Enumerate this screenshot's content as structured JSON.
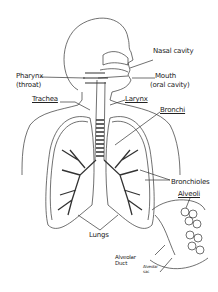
{
  "diagram": {
    "labels": {
      "nasal_cavity": "Nasal cavity",
      "pharynx": "Pharynx",
      "throat": "(throat)",
      "mouth": "Mouth",
      "oral_cavity": "(oral cavity)",
      "trachea": "Trachea",
      "larynx": "Larynx",
      "bronchi": "Bronchi",
      "bronchioles": "Bronchioles",
      "alveoli": "Alveoli",
      "lungs": "Lungs",
      "alveolar_duct_1": "Alveolar",
      "alveolar_duct_2": "Duct",
      "alveolar_sac_1": "Alveolar",
      "alveolar_sac_2": "sac"
    },
    "colors": {
      "line": "#333333",
      "background": "#ffffff"
    }
  }
}
